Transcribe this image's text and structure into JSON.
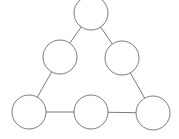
{
  "diagram": {
    "type": "graph",
    "shape": "triangle",
    "stroke_color": "#7a7a7a",
    "background": "#ffffff",
    "node_radius": 17,
    "nodes": [
      {
        "id": "top",
        "cx": 91,
        "cy": 13,
        "label": ""
      },
      {
        "id": "mid-left",
        "cx": 60,
        "cy": 57,
        "label": ""
      },
      {
        "id": "mid-right",
        "cx": 122,
        "cy": 58,
        "label": ""
      },
      {
        "id": "bottom-left",
        "cx": 29,
        "cy": 112,
        "label": ""
      },
      {
        "id": "bottom-middle",
        "cx": 91,
        "cy": 112,
        "label": ""
      },
      {
        "id": "bottom-right",
        "cx": 153,
        "cy": 113,
        "label": ""
      }
    ],
    "edges": [
      {
        "from": "top",
        "to": "mid-left"
      },
      {
        "from": "top",
        "to": "mid-right"
      },
      {
        "from": "mid-left",
        "to": "bottom-left"
      },
      {
        "from": "mid-right",
        "to": "bottom-right"
      },
      {
        "from": "bottom-left",
        "to": "bottom-middle"
      },
      {
        "from": "bottom-middle",
        "to": "bottom-right"
      }
    ]
  }
}
